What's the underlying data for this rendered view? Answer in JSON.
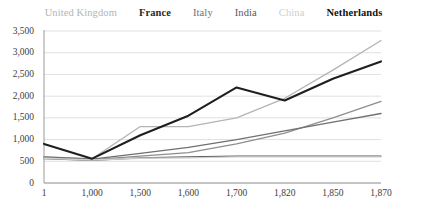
{
  "chart_data": {
    "type": "line",
    "title": "",
    "xlabel": "",
    "ylabel": "",
    "categories": [
      "1",
      "1,000",
      "1,500",
      "1,600",
      "1,700",
      "1,820",
      "1,850",
      "1,870"
    ],
    "ylim": [
      0,
      3500
    ],
    "ytick_values": [
      0,
      500,
      1000,
      1500,
      2000,
      2500,
      3000,
      3500
    ],
    "ytick_labels": [
      "0",
      "500",
      "1,000",
      "1,500",
      "2,000",
      "2,500",
      "3,000",
      "3,500"
    ],
    "grid": true,
    "legend_position": "top",
    "series": [
      {
        "name": "United Kingdom",
        "color": "#b4b4b4",
        "width": 1.3,
        "legend_weight": "normal",
        "values": [
          600,
          560,
          1300,
          1300,
          1500,
          1950,
          2600,
          3280
        ]
      },
      {
        "name": "France",
        "color": "#8e8e8e",
        "width": 1.3,
        "legend_weight": "bold",
        "values": [
          580,
          540,
          620,
          700,
          900,
          1150,
          1500,
          1880
        ]
      },
      {
        "name": "Italy",
        "color": "#707070",
        "width": 1.3,
        "legend_weight": "normal",
        "values": [
          600,
          550,
          680,
          820,
          1000,
          1200,
          1400,
          1600
        ]
      },
      {
        "name": "India",
        "color": "#5a5a5a",
        "width": 1.3,
        "legend_weight": "normal",
        "values": [
          560,
          520,
          580,
          600,
          620,
          620,
          620,
          620
        ]
      },
      {
        "name": "China",
        "color": "#cfcfcf",
        "width": 1.3,
        "legend_weight": "normal",
        "values": [
          570,
          530,
          570,
          580,
          600,
          600,
          600,
          600
        ]
      },
      {
        "name": "Netherlands",
        "color": "#1f1f1f",
        "width": 2.1,
        "legend_weight": "bold",
        "values": [
          900,
          560,
          1100,
          1550,
          2200,
          1900,
          2400,
          2800
        ]
      }
    ]
  },
  "legend": {
    "entries": [
      {
        "label": "United Kingdom"
      },
      {
        "label": "France"
      },
      {
        "label": "Italy"
      },
      {
        "label": "India"
      },
      {
        "label": "China"
      },
      {
        "label": "Netherlands"
      }
    ]
  }
}
